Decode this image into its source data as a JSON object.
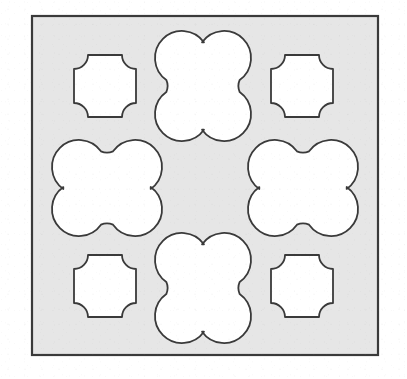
{
  "figure": {
    "canvas": {
      "width": 407,
      "height": 379
    },
    "colors": {
      "page_background": "#ffffff",
      "panel_fill": "#e6e6e6",
      "panel_stroke": "#3a3a3a",
      "shape_fill": "#ffffff",
      "shape_stroke": "#3a3a3a"
    },
    "panel": {
      "name": "gray-square-panel",
      "x": 32,
      "y": 16,
      "width": 346,
      "height": 339,
      "stroke_width": 2.2
    },
    "grid": {
      "columns": 3,
      "rows": 3,
      "center_cell": "empty",
      "cell_centers_x": [
        105,
        204,
        303
      ],
      "cell_centers_y": [
        86,
        188,
        289
      ]
    },
    "shapes": [
      {
        "id": "cross-top-left",
        "name": "concave-cross-top-left",
        "kind": "concave-cross",
        "cell": "top-left",
        "cx": 105,
        "cy": 86,
        "half_size": 31,
        "arc_radius": 14,
        "label": "Concave cross"
      },
      {
        "id": "clover-top-center",
        "name": "vertical-clover-top-center",
        "kind": "clover-vertical",
        "cell": "top-center",
        "cx": 203,
        "cy": 86,
        "lobe_radius": 27,
        "offset_x": 21,
        "offset_y": 28,
        "waist_radius": 15,
        "label": "Vertical four-lobed clover"
      },
      {
        "id": "cross-top-right",
        "name": "concave-cross-top-right",
        "kind": "concave-cross",
        "cell": "top-right",
        "cx": 302,
        "cy": 86,
        "half_size": 31,
        "arc_radius": 14,
        "label": "Concave cross"
      },
      {
        "id": "clover-middle-left",
        "name": "horizontal-clover-middle-left",
        "kind": "clover-horizontal",
        "cell": "middle-left",
        "cx": 107,
        "cy": 188,
        "lobe_radius": 27,
        "offset_x": 28,
        "offset_y": 21,
        "waist_radius": 15,
        "label": "Horizontal four-lobed clover"
      },
      {
        "id": "center-empty",
        "name": "empty-center-cell",
        "kind": "empty",
        "cell": "middle-center",
        "cx": 204,
        "cy": 188,
        "label": "Empty center"
      },
      {
        "id": "clover-middle-right",
        "name": "horizontal-clover-middle-right",
        "kind": "clover-horizontal",
        "cell": "middle-right",
        "cx": 303,
        "cy": 188,
        "lobe_radius": 27,
        "offset_x": 28,
        "offset_y": 21,
        "waist_radius": 15,
        "label": "Horizontal four-lobed clover"
      },
      {
        "id": "cross-bottom-left",
        "name": "concave-cross-bottom-left",
        "kind": "concave-cross",
        "cell": "bottom-left",
        "cx": 105,
        "cy": 286,
        "half_size": 31,
        "arc_radius": 14,
        "label": "Concave cross"
      },
      {
        "id": "clover-bottom-center",
        "name": "vertical-clover-bottom-center",
        "kind": "clover-vertical",
        "cell": "bottom-center",
        "cx": 203,
        "cy": 288,
        "lobe_radius": 27,
        "offset_x": 21,
        "offset_y": 28,
        "waist_radius": 15,
        "label": "Vertical four-lobed clover"
      },
      {
        "id": "cross-bottom-right",
        "name": "concave-cross-bottom-right",
        "kind": "concave-cross",
        "cell": "bottom-right",
        "cx": 302,
        "cy": 286,
        "half_size": 31,
        "arc_radius": 14,
        "label": "Concave cross"
      }
    ]
  }
}
